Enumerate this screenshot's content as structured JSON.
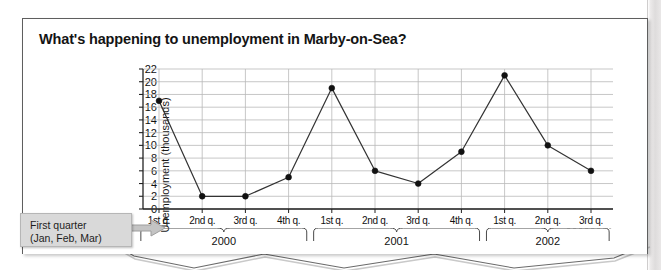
{
  "figure": {
    "title": "What's happening to unemployment in Marby-on-Sea?",
    "callout": {
      "line1": "First quarter",
      "line2": "(Jan, Feb, Mar)",
      "arrow_icon": "arrow-right-icon"
    }
  },
  "chart_data": {
    "type": "line",
    "title": "What's happening to unemployment in Marby-on-Sea?",
    "xlabel": "",
    "ylabel": "Unemployment (thousands)",
    "ylim": [
      0,
      22
    ],
    "ytick_step": 2,
    "yticks": [
      0,
      2,
      4,
      6,
      8,
      10,
      12,
      14,
      16,
      18,
      20,
      22
    ],
    "grid": true,
    "legend": "none",
    "marker": "filled-circle",
    "line_color": "#333333",
    "categories": [
      "1st q.",
      "2nd q.",
      "3rd q.",
      "4th q.",
      "1st q.",
      "2nd q.",
      "3rd q.",
      "4th q.",
      "1st q.",
      "2nd q.",
      "3rd q."
    ],
    "values": [
      17,
      2,
      2,
      5,
      19,
      6,
      4,
      9,
      21,
      10,
      6
    ],
    "groups": [
      {
        "label": "2000",
        "start": 0,
        "end": 3
      },
      {
        "label": "2001",
        "start": 4,
        "end": 7
      },
      {
        "label": "2002",
        "start": 8,
        "end": 10
      }
    ]
  }
}
